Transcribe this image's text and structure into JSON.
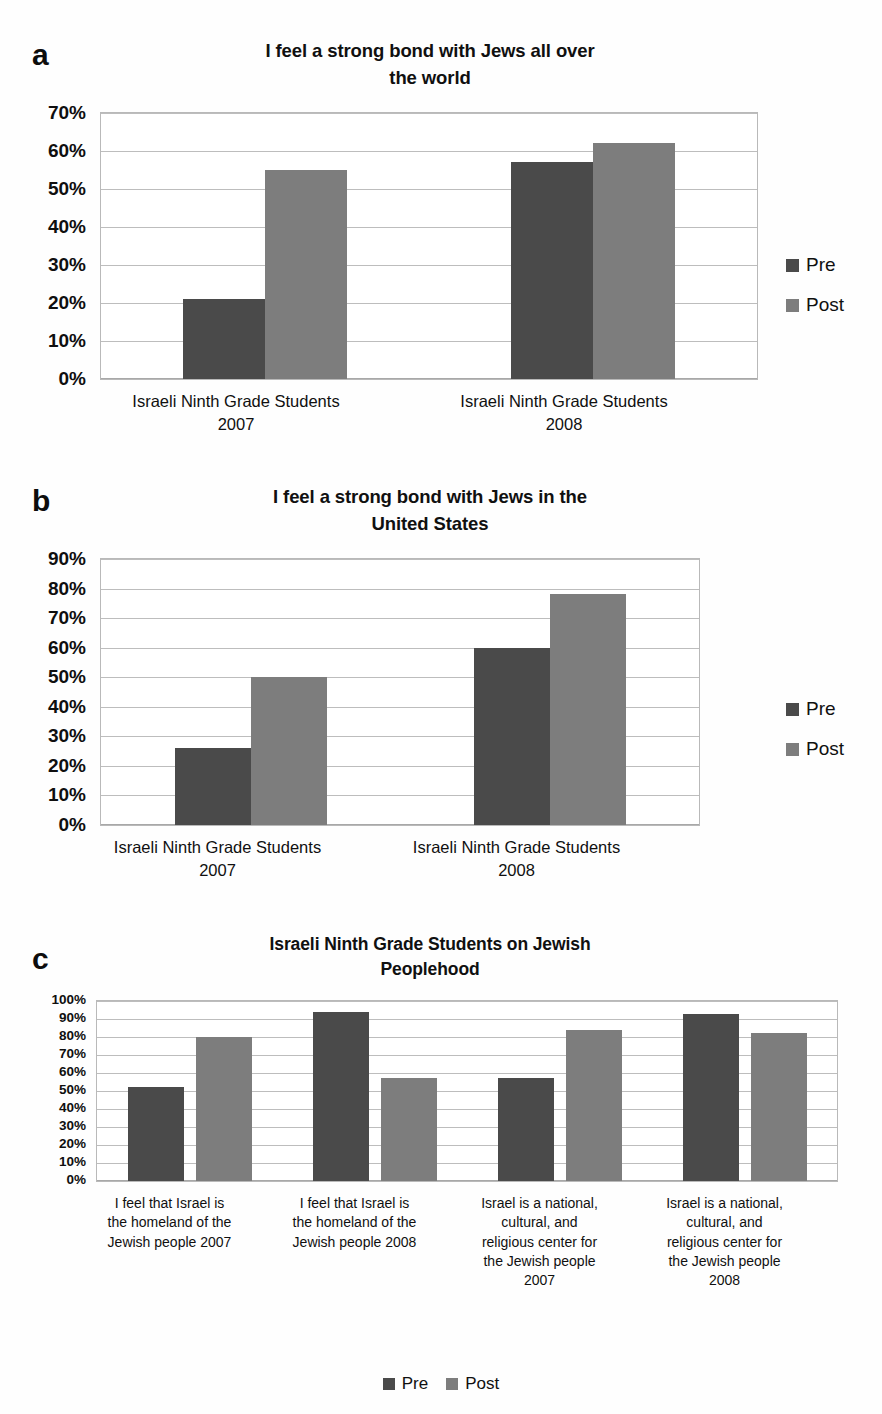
{
  "running_head": {
    "left": "",
    "right": ""
  },
  "legend": {
    "pre_label": "Pre",
    "post_label": "Post"
  },
  "colors": {
    "pre": "#4a4a4a",
    "post": "#7d7d7d",
    "grid": "#bdbdbd",
    "text": "#101010",
    "background": "#ffffff"
  },
  "panels": [
    {
      "letter": "a",
      "title": "I feel a strong bond with Jews all over the world",
      "title_line1": "I feel a strong bond with Jews all over",
      "title_line2": "the world"
    },
    {
      "letter": "b",
      "title": "I feel a strong bond with Jews in the United States",
      "title_line1": "I feel a strong bond with Jews in the",
      "title_line2": "United States"
    },
    {
      "letter": "c",
      "title": "Israeli Ninth Grade Students on Jewish Peoplehood",
      "title_line1": "Israeli Ninth Grade Students on Jewish",
      "title_line2": "Peoplehood"
    }
  ],
  "chart_data": [
    {
      "type": "bar",
      "panel": "a",
      "title": "I feel a strong bond with Jews all over the world",
      "xlabel": "",
      "ylabel": "",
      "ylim": [
        0,
        70
      ],
      "ytick_labels": [
        "0%",
        "10%",
        "20%",
        "30%",
        "40%",
        "50%",
        "60%",
        "70%"
      ],
      "yticks": [
        0,
        10,
        20,
        30,
        40,
        50,
        60,
        70
      ],
      "grid": true,
      "legend_position": "right",
      "categories": [
        "Israeli Ninth Grade Students 2007",
        "Israeli Ninth Grade Students 2008"
      ],
      "category_lines": [
        [
          "Israeli Ninth Grade Students",
          "2007"
        ],
        [
          "Israeli Ninth Grade Students",
          "2008"
        ]
      ],
      "series": [
        {
          "name": "Pre",
          "values": [
            21,
            57
          ]
        },
        {
          "name": "Post",
          "values": [
            55,
            62
          ]
        }
      ]
    },
    {
      "type": "bar",
      "panel": "b",
      "title": "I feel a strong bond with Jews in the United States",
      "xlabel": "",
      "ylabel": "",
      "ylim": [
        0,
        90
      ],
      "ytick_labels": [
        "0%",
        "10%",
        "20%",
        "30%",
        "40%",
        "50%",
        "60%",
        "70%",
        "80%",
        "90%"
      ],
      "yticks": [
        0,
        10,
        20,
        30,
        40,
        50,
        60,
        70,
        80,
        90
      ],
      "grid": true,
      "legend_position": "right",
      "categories": [
        "Israeli Ninth Grade Students 2007",
        "Israeli Ninth Grade Students 2008"
      ],
      "category_lines": [
        [
          "Israeli Ninth Grade Students",
          "2007"
        ],
        [
          "Israeli Ninth Grade Students",
          "2008"
        ]
      ],
      "series": [
        {
          "name": "Pre",
          "values": [
            26,
            60
          ]
        },
        {
          "name": "Post",
          "values": [
            50,
            78
          ]
        }
      ]
    },
    {
      "type": "bar",
      "panel": "c",
      "title": "Israeli Ninth Grade Students on Jewish Peoplehood",
      "xlabel": "",
      "ylabel": "",
      "ylim": [
        0,
        100
      ],
      "ytick_labels": [
        "0%",
        "10%",
        "20%",
        "30%",
        "40%",
        "50%",
        "60%",
        "70%",
        "80%",
        "90%",
        "100%"
      ],
      "yticks": [
        0,
        10,
        20,
        30,
        40,
        50,
        60,
        70,
        80,
        90,
        100
      ],
      "grid": true,
      "legend_position": "bottom",
      "categories": [
        "I feel that Israel is the homeland of the Jewish people 2007",
        "I feel that Israel is the homeland of the Jewish people 2008",
        "Israel is a national, cultural, and religious center for the Jewish people 2007",
        "Israel is a national, cultural, and religious center for the Jewish people 2008"
      ],
      "category_lines": [
        [
          "I feel that Israel is",
          "the homeland of the",
          "Jewish people 2007"
        ],
        [
          "I feel that Israel is",
          "the homeland of the",
          "Jewish people 2008"
        ],
        [
          "Israel is a national,",
          "cultural, and",
          "religious center for",
          "the Jewish people",
          "2007"
        ],
        [
          "Israel is a national,",
          "cultural, and",
          "religious center for",
          "the Jewish people",
          "2008"
        ]
      ],
      "series": [
        {
          "name": "Pre",
          "values": [
            52,
            94,
            57,
            93
          ]
        },
        {
          "name": "Post",
          "values": [
            80,
            57,
            84,
            82
          ]
        }
      ]
    }
  ]
}
